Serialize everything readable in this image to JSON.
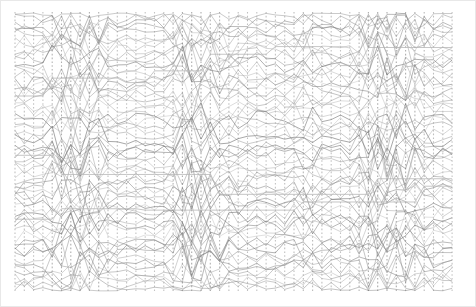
{
  "figure": {
    "title": "",
    "subtitle": "",
    "background_color": "#ffffff",
    "border_color": "#e8e8e8",
    "width": 476,
    "height": 307
  },
  "chart_data": {
    "type": "line",
    "title": "",
    "subtitle": "",
    "xlabel": "",
    "ylabel": "",
    "xlim": [
      0,
      48
    ],
    "ylim": [
      0,
      280
    ],
    "grid": false,
    "legend": null,
    "legend_position": "none",
    "axis_count": 48,
    "axis_x_start": 15,
    "axis_x_step": 9.3,
    "plot_top": 12,
    "plot_bottom": 292,
    "line_color": "#8a8a8a",
    "line_color_dark": "#6e6e6e",
    "line_color_light": "#b4b4b4",
    "line_width": 0.7,
    "trace_count": 62,
    "series": [
      {
        "name": "axis-ticks",
        "style": "dotted-vertical",
        "color": "#9a9a9a",
        "values": [
          280,
          280,
          280,
          280,
          280,
          280,
          280,
          280,
          280,
          280,
          280,
          280,
          280,
          280,
          280,
          280,
          280,
          280,
          280,
          280,
          280,
          280,
          280,
          280,
          280,
          280,
          280,
          280,
          280,
          280,
          280,
          280,
          280,
          280,
          280,
          280,
          280,
          280,
          280,
          280,
          280,
          280,
          280,
          280,
          280,
          280,
          280,
          280
        ]
      },
      {
        "name": "crossing-density-per-axis",
        "style": "amplitude-profile",
        "color": "#8a8a8a",
        "values": [
          0.28,
          0.3,
          0.22,
          0.18,
          0.62,
          0.78,
          0.82,
          0.8,
          0.74,
          0.7,
          0.3,
          0.22,
          0.2,
          0.18,
          0.16,
          0.18,
          0.22,
          0.55,
          0.88,
          0.92,
          0.86,
          0.7,
          0.55,
          0.4,
          0.34,
          0.28,
          0.24,
          0.22,
          0.2,
          0.26,
          0.38,
          0.52,
          0.46,
          0.3,
          0.22,
          0.2,
          0.24,
          0.6,
          0.84,
          0.9,
          0.88,
          0.82,
          0.76,
          0.66,
          0.48,
          0.3,
          0.22,
          0.18
        ]
      }
    ],
    "categories": [
      "a1",
      "a2",
      "a3",
      "a4",
      "a5",
      "a6",
      "a7",
      "a8",
      "a9",
      "a10",
      "a11",
      "a12",
      "a13",
      "a14",
      "a15",
      "a16",
      "a17",
      "a18",
      "a19",
      "a20",
      "a21",
      "a22",
      "a23",
      "a24",
      "a25",
      "a26",
      "a27",
      "a28",
      "a29",
      "a30",
      "a31",
      "a32",
      "a33",
      "a34",
      "a35",
      "a36",
      "a37",
      "a38",
      "a39",
      "a40",
      "a41",
      "a42",
      "a43",
      "a44",
      "a45",
      "a46",
      "a47",
      "a48"
    ],
    "tick_labels_x": [],
    "tick_labels_y": [],
    "annotations": []
  }
}
